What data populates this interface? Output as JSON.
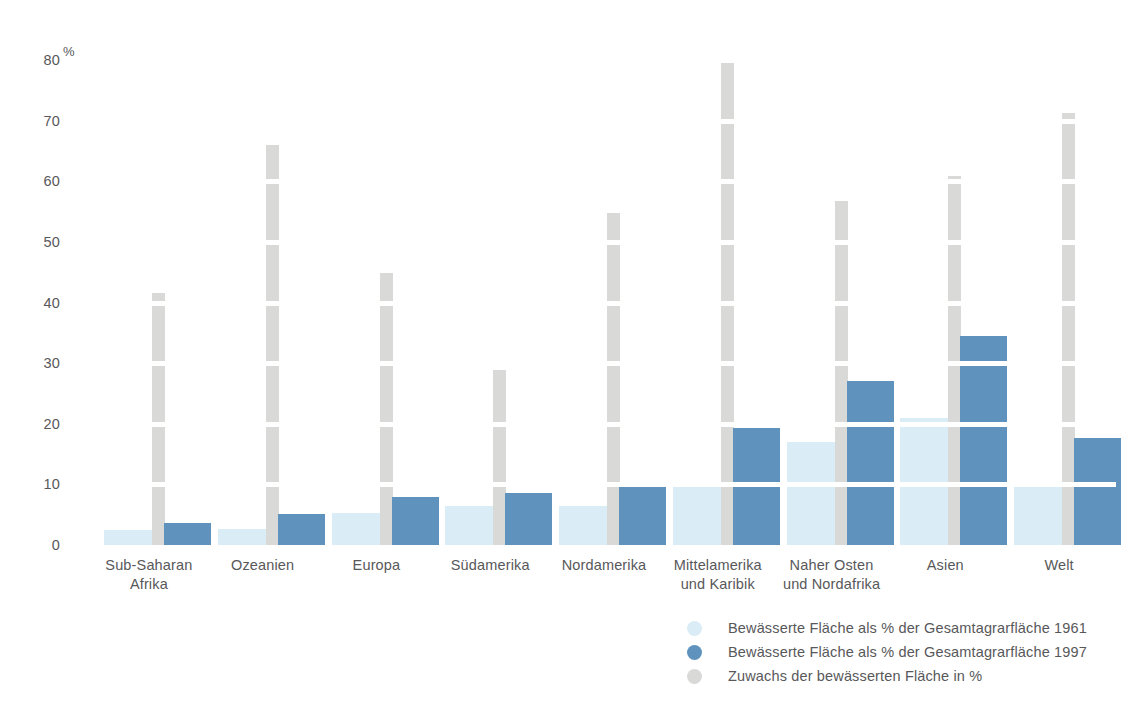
{
  "chart_data": {
    "type": "bar",
    "title": "",
    "subtitle": "",
    "xlabel": "",
    "ylabel": "%",
    "ylim": [
      0,
      80
    ],
    "yticks": [
      0,
      10,
      20,
      30,
      40,
      50,
      60,
      70,
      80
    ],
    "grid": false,
    "legend_position": "bottom-right",
    "categories": [
      "Sub-Saharan\nAfrika",
      "Ozeanien",
      "Europa",
      "Südamerika",
      "Nordamerika",
      "Mittelamerika\nund Karibik",
      "Naher Osten\nund Nordafrika",
      "Asien",
      "Welt"
    ],
    "series": [
      {
        "name": "Bewässerte Fläche als % der Gesamtagrarfläche 1961",
        "color": "#daecf5",
        "values": [
          2.4,
          2.6,
          5.3,
          6.4,
          6.4,
          9.8,
          17.0,
          21.0,
          9.7
        ]
      },
      {
        "name": "Bewässerte Fläche als % der Gesamtagrarfläche 1997",
        "color": "#5f93bd",
        "values": [
          3.7,
          5.1,
          7.9,
          8.6,
          9.8,
          19.3,
          27.0,
          34.5,
          17.7
        ]
      },
      {
        "name": "Zuwachs der bewässerten Fläche in %",
        "color": "#d9d9d7",
        "values": [
          41.5,
          66.0,
          44.8,
          28.8,
          54.8,
          79.8,
          56.8,
          60.8,
          71.3
        ]
      }
    ]
  },
  "axis": {
    "unit": "%",
    "tick_labels": [
      "80",
      "70",
      "60",
      "50",
      "40",
      "30",
      "20",
      "10",
      "0"
    ]
  },
  "categories": [
    {
      "line1": "Sub-Saharan",
      "line2": "Afrika"
    },
    {
      "line1": "Ozeanien",
      "line2": ""
    },
    {
      "line1": "Europa",
      "line2": ""
    },
    {
      "line1": "Südamerika",
      "line2": ""
    },
    {
      "line1": "Nordamerika",
      "line2": ""
    },
    {
      "line1": "Mittelamerika",
      "line2": "und Karibik"
    },
    {
      "line1": "Naher Osten",
      "line2": "und Nordafrika"
    },
    {
      "line1": "Asien",
      "line2": ""
    },
    {
      "line1": "Welt",
      "line2": ""
    }
  ],
  "legend": [
    {
      "label": "Bewässerte Fläche als % der Gesamtagrarfläche 1961",
      "color": "#daecf5"
    },
    {
      "label": "Bewässerte Fläche als % der Gesamtagrarfläche 1997",
      "color": "#5f93bd"
    },
    {
      "label": "Zuwachs der bewässerten Fläche in %",
      "color": "#d9d9d7"
    }
  ]
}
